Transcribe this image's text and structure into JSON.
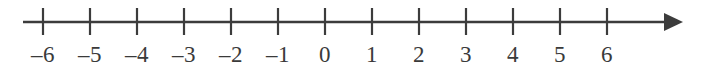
{
  "figure": {
    "background_color": "#ffffff",
    "line_color": "#3c3c3c",
    "label_color": "#3a3a3a"
  },
  "chart_data": {
    "type": "line",
    "title": "",
    "xlabel": "",
    "ylabel": "",
    "grid": false,
    "legend": null,
    "axis": {
      "orientation": "horizontal",
      "xlim": [
        -6,
        6
      ],
      "tick_step": 1,
      "arrow_end": "right",
      "line_start_px": 23,
      "line_end_px": 683,
      "unit_px": 47,
      "origin_px": 325,
      "axis_y_px": 22,
      "tick_top_px": 8,
      "tick_bottom_px": 35,
      "label_baseline_px": 62
    },
    "categories": [
      "-6",
      "-5",
      "-4",
      "-3",
      "-2",
      "-1",
      "0",
      "1",
      "2",
      "3",
      "4",
      "5",
      "6"
    ],
    "values": [
      -6,
      -5,
      -4,
      -3,
      -2,
      -1,
      0,
      1,
      2,
      3,
      4,
      5,
      6
    ],
    "ticks": [
      {
        "value": -6,
        "label": "–6",
        "x": 43
      },
      {
        "value": -5,
        "label": "–5",
        "x": 90
      },
      {
        "value": -4,
        "label": "–4",
        "x": 137
      },
      {
        "value": -3,
        "label": "–3",
        "x": 184
      },
      {
        "value": -2,
        "label": "–2",
        "x": 231
      },
      {
        "value": -1,
        "label": "–1",
        "x": 278
      },
      {
        "value": 0,
        "label": "0",
        "x": 325
      },
      {
        "value": 1,
        "label": "1",
        "x": 372
      },
      {
        "value": 2,
        "label": "2",
        "x": 419
      },
      {
        "value": 3,
        "label": "3",
        "x": 466
      },
      {
        "value": 4,
        "label": "4",
        "x": 513
      },
      {
        "value": 5,
        "label": "5",
        "x": 560
      },
      {
        "value": 6,
        "label": "6",
        "x": 607
      }
    ]
  }
}
